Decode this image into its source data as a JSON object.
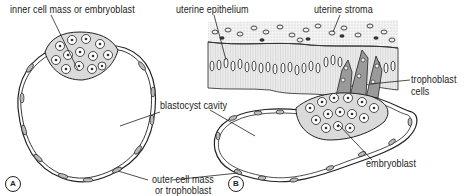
{
  "figure": {
    "panel_a": {
      "label": "A",
      "annotations": {
        "inner_cell_mass": "inner cell mass or embryoblast",
        "blastocyst_cavity": "blastocyst cavity",
        "outer_cell_mass_line1": "outer cell mass",
        "outer_cell_mass_line2": "or trophoblast"
      }
    },
    "panel_b": {
      "label": "B",
      "annotations": {
        "uterine_epithelium": "uterine epithelium",
        "uterine_stroma": "uterine stroma",
        "trophoblast_cells_line1": "trophoblast",
        "trophoblast_cells_line2": "cells",
        "embryoblast": "embryoblast"
      }
    },
    "colors": {
      "ink": "#222222",
      "cell_fill": "#d9d9d9",
      "epithelium_fill": "#e6e6e6",
      "stroma_fill": "#f0f0f0"
    }
  }
}
